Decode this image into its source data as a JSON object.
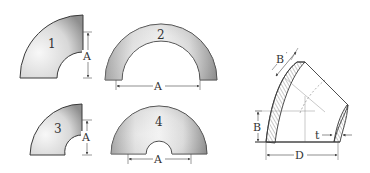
{
  "diagram": {
    "colors": {
      "outline": "#3a3a3a",
      "fill_light": "#f4f4f4",
      "fill_dark": "#a8a8a8",
      "dim_line": "#555555"
    },
    "figures": [
      {
        "id": "1",
        "label": "1",
        "shape": "90-degree long radius elbow",
        "dimensions": [
          "A"
        ]
      },
      {
        "id": "2",
        "label": "2",
        "shape": "180-degree long radius return",
        "dimensions": [
          "A"
        ]
      },
      {
        "id": "3",
        "label": "3",
        "shape": "90-degree short radius elbow",
        "dimensions": [
          "A"
        ]
      },
      {
        "id": "4",
        "label": "4",
        "shape": "180-degree short radius return",
        "dimensions": [
          "A"
        ]
      },
      {
        "id": "5",
        "label": "",
        "shape": "45-degree elbow cross-section",
        "dimensions": [
          "B",
          "B",
          "t",
          "D"
        ]
      }
    ],
    "dim_labels": {
      "fig1_A": "A",
      "fig2_A": "A",
      "fig3_A": "A",
      "fig4_A": "A",
      "fig5_B_top": "B",
      "fig5_B_left": "B",
      "fig5_t": "t",
      "fig5_D": "D"
    }
  }
}
